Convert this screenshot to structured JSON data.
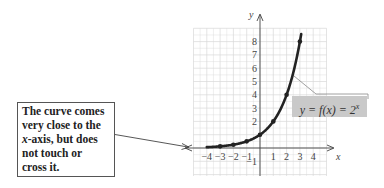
{
  "diagram": {
    "function_label": "y = f(x) = 2",
    "function_exponent": "x",
    "axis_labels": {
      "x": "x",
      "y": "y"
    },
    "x_ticks": [
      "−4",
      "−3",
      "−2",
      "−1",
      "1",
      "2",
      "3",
      "4"
    ],
    "y_ticks": [
      "8",
      "7",
      "6",
      "5",
      "4",
      "3",
      "2",
      "1",
      "−1"
    ],
    "note_lines": [
      "The curve comes",
      "very close to the",
      "-axis, but does",
      "not touch or",
      "cross it."
    ],
    "note_italic_prefix": "x",
    "points": [
      {
        "x": -3,
        "y": 0.125
      },
      {
        "x": -2,
        "y": 0.25
      },
      {
        "x": -1,
        "y": 0.5
      },
      {
        "x": 0,
        "y": 1
      },
      {
        "x": 1,
        "y": 2
      },
      {
        "x": 2,
        "y": 4
      },
      {
        "x": 3,
        "y": 8
      }
    ],
    "colors": {
      "curve": "#222222",
      "grid": "#d9d9d9",
      "axis": "#444444",
      "label_bg": "#c9c9c9"
    }
  }
}
